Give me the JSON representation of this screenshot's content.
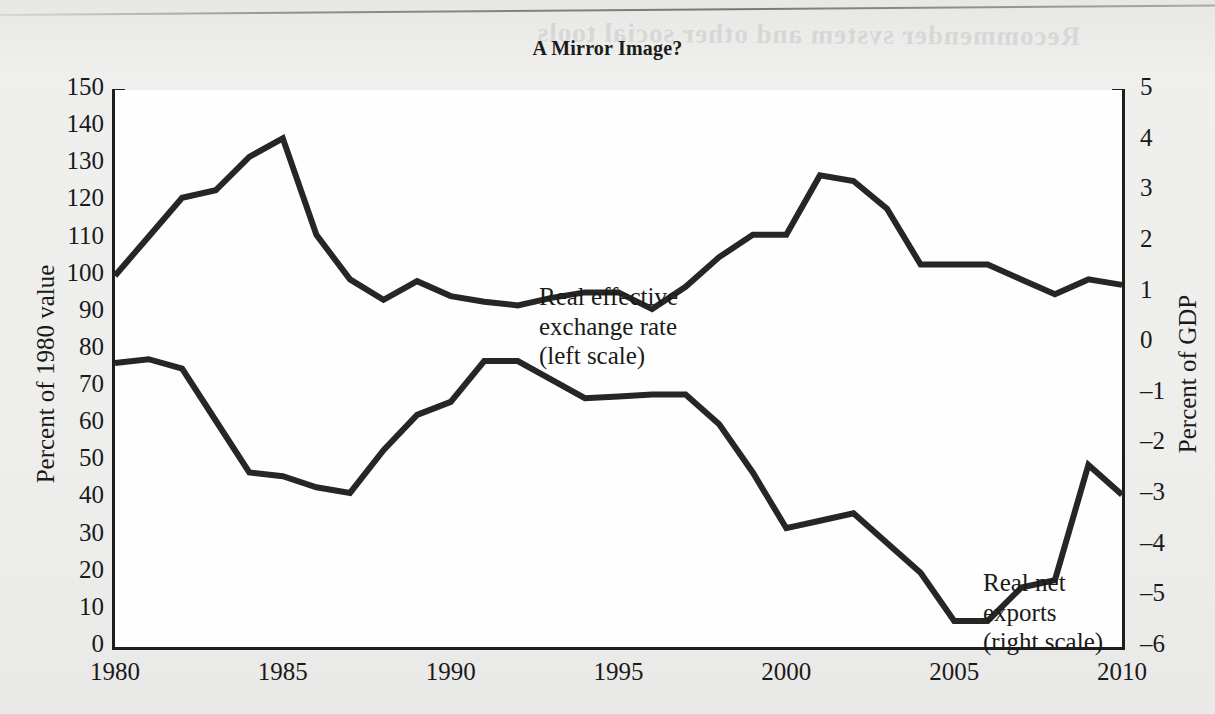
{
  "figure": {
    "title": "A Mirror Image?",
    "bleed_text": "Recommender system and other social tools"
  },
  "chart_data": {
    "type": "line",
    "title": "A Mirror Image?",
    "xlabel": "",
    "ylabel": "Percent of 1980 value",
    "ylabel_right": "Percent of GDP",
    "grid": false,
    "legend_position": "inline-annotations",
    "xlim": [
      1980,
      2010
    ],
    "xticks_major": [
      1980,
      1985,
      1990,
      1995,
      2000,
      2005,
      2010
    ],
    "xtick_labels": [
      "1980",
      "1985",
      "1990",
      "1995",
      "2000",
      "2005",
      "2010"
    ],
    "xticks_minor_step": 1,
    "ylim_left": [
      0,
      150
    ],
    "yticks_left": [
      0,
      10,
      20,
      30,
      40,
      50,
      60,
      70,
      80,
      90,
      100,
      110,
      120,
      130,
      140,
      150
    ],
    "ytick_labels_left": [
      "0",
      "10",
      "20",
      "30",
      "40",
      "50",
      "60",
      "70",
      "80",
      "90",
      "100",
      "110",
      "120",
      "130",
      "140",
      "150"
    ],
    "ylim_right": [
      -6,
      5
    ],
    "yticks_right": [
      -6,
      -5,
      -4,
      -3,
      -2,
      -1,
      0,
      1,
      2,
      3,
      4,
      5
    ],
    "ytick_labels_right": [
      "–6",
      "–5",
      "–4",
      "–3",
      "–2",
      "–1",
      "0",
      "1",
      "2",
      "3",
      "4",
      "5"
    ],
    "x": [
      1980,
      1981,
      1982,
      1983,
      1984,
      1985,
      1986,
      1987,
      1988,
      1989,
      1990,
      1991,
      1992,
      1993,
      1994,
      1995,
      1996,
      1997,
      1998,
      1999,
      2000,
      2001,
      2002,
      2003,
      2004,
      2005,
      2006,
      2007,
      2008,
      2009,
      2010
    ],
    "series": [
      {
        "name": "Real effective exchange rate",
        "axis": "left",
        "unit": "Percent of 1980 value",
        "annotation": "Real effective\nexchange rate\n(left scale)",
        "color": "#262624",
        "values": [
          100,
          110.5,
          121,
          123,
          132,
          137,
          111,
          99,
          93.5,
          98.5,
          94.5,
          93,
          92,
          94,
          95.5,
          95.5,
          91,
          97,
          105,
          111,
          111,
          127,
          125.5,
          118,
          103,
          103,
          103,
          99,
          95,
          99,
          97.5
        ]
      },
      {
        "name": "Real net exports",
        "axis": "right",
        "unit": "Percent of GDP",
        "annotation": "Real net exports\n(right scale)",
        "color": "#262624",
        "values_left_scale": [
          76.5,
          77.5,
          75,
          61,
          47,
          46,
          43,
          41.5,
          53,
          62.5,
          66,
          77,
          77,
          72,
          67,
          67.5,
          68,
          68,
          60,
          47,
          32,
          34,
          36,
          28,
          20,
          7,
          7,
          16,
          18,
          49,
          41
        ],
        "values": [
          -0.4,
          -0.33,
          -0.52,
          -1.55,
          -2.58,
          -2.65,
          -2.87,
          -2.98,
          -2.13,
          -1.43,
          -1.17,
          -0.37,
          -0.37,
          -0.73,
          -1.1,
          -1.06,
          -1.02,
          -1.02,
          -1.6,
          -2.55,
          -3.65,
          -3.5,
          -3.35,
          -3.94,
          -4.53,
          -5.48,
          -5.48,
          -5.02,
          -4.87,
          -2.57,
          -3.16
        ]
      }
    ]
  },
  "axes": {
    "left": {
      "label": "Percent of 1980 value",
      "ticks": [
        "150",
        "140",
        "130",
        "120",
        "110",
        "100",
        "90",
        "80",
        "70",
        "60",
        "50",
        "40",
        "30",
        "20",
        "10",
        "0"
      ]
    },
    "right": {
      "label": "Percent of GDP",
      "ticks": [
        "5",
        "4",
        "3",
        "2",
        "1",
        "0",
        "–1",
        "–2",
        "–3",
        "–4",
        "–5",
        "–6"
      ]
    },
    "bottom": {
      "ticks": [
        "1980",
        "1985",
        "1990",
        "1995",
        "2000",
        "2005",
        "2010"
      ]
    }
  },
  "annotations": {
    "exchange_rate": "Real effective\nexchange rate\n(left scale)",
    "net_exports": "Real net exports\n(right scale)"
  },
  "colors": {
    "line": "#262624",
    "axis": "#1e1e1c",
    "plot_background": "#fefefe",
    "page_background": "#ececeb",
    "text": "#1a1a18"
  }
}
